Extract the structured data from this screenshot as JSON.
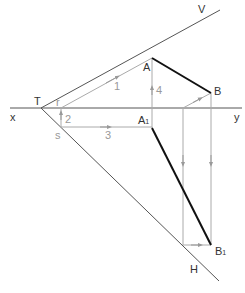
{
  "diagram": {
    "type": "descriptive-geometry",
    "labels": {
      "V": "V",
      "H": "H",
      "x": "x",
      "y": "y",
      "T": "T",
      "A": "A",
      "B": "B",
      "A1": "A",
      "A1_sub": "1",
      "B1": "B",
      "B1_sub": "1",
      "r": "r",
      "s": "s",
      "step1": "1",
      "step2": "2",
      "step3": "3",
      "step4": "4"
    },
    "colors": {
      "main": "#333333",
      "thick": "#111111",
      "construction": "#aaaaaa"
    }
  }
}
